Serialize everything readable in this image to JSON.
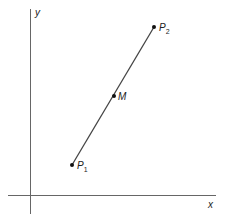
{
  "diagram": {
    "title": "",
    "axes": {
      "x_label": "x",
      "y_label": "y",
      "color": "#555555"
    },
    "segment": {
      "color": "#444444",
      "from": "P1",
      "to": "P2"
    },
    "points": [
      {
        "id": "P1",
        "letter": "P",
        "subscript": "1",
        "px": 72,
        "py": 165
      },
      {
        "id": "M",
        "letter": "M",
        "subscript": "",
        "px": 114,
        "py": 96
      },
      {
        "id": "P2",
        "letter": "P",
        "subscript": "2",
        "px": 154,
        "py": 27
      }
    ]
  }
}
